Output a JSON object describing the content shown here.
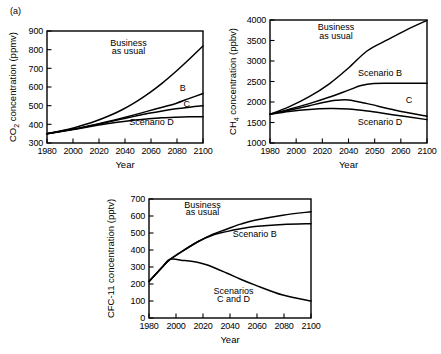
{
  "figure": {
    "panel_tag": "(a)",
    "xlabel": "Year"
  },
  "chart_data": [
    {
      "id": "co2",
      "type": "line",
      "title": "",
      "xlabel": "Year",
      "ylabel": "CO2 concentration (ppmv)",
      "ylabel_parts": {
        "pre": "CO",
        "sub": "2",
        "post": " concentration (ppmv)"
      },
      "xlim": [
        1985,
        2100
      ],
      "ylim": [
        300,
        900
      ],
      "yticks": [
        300,
        400,
        500,
        600,
        700,
        800,
        900
      ],
      "xticks": [
        1980,
        2000,
        2020,
        2040,
        2060,
        2080,
        2100
      ],
      "xtick_labels": [
        "1980",
        "2000",
        "2020",
        "2040",
        "2060",
        "2080",
        "2100"
      ],
      "grid": false,
      "legend": "inline-annotations",
      "annotations": [
        {
          "text": "Business",
          "x": 2045,
          "y": 820
        },
        {
          "text": "as usual",
          "x": 2045,
          "y": 775
        },
        {
          "text": "B",
          "x": 2085,
          "y": 580
        },
        {
          "text": "C",
          "x": 2088,
          "y": 495
        },
        {
          "text": "Scenario D",
          "x": 2062,
          "y": 395
        }
      ],
      "series": [
        {
          "name": "Business as usual",
          "x": [
            1985,
            2000,
            2010,
            2020,
            2030,
            2040,
            2050,
            2060,
            2070,
            2080,
            2090,
            2100
          ],
          "values": [
            350,
            372,
            392,
            415,
            443,
            477,
            518,
            566,
            621,
            683,
            750,
            820
          ]
        },
        {
          "name": "Scenario B",
          "x": [
            1985,
            2000,
            2010,
            2020,
            2030,
            2040,
            2050,
            2060,
            2070,
            2080,
            2090,
            2100
          ],
          "values": [
            350,
            369,
            382,
            398,
            415,
            433,
            452,
            472,
            492,
            512,
            539,
            565
          ]
        },
        {
          "name": "Scenario C",
          "x": [
            1985,
            2000,
            2010,
            2020,
            2030,
            2040,
            2050,
            2060,
            2070,
            2080,
            2090,
            2100
          ],
          "values": [
            350,
            368,
            381,
            396,
            412,
            428,
            444,
            459,
            472,
            483,
            492,
            500
          ]
        },
        {
          "name": "Scenario D",
          "x": [
            1985,
            2000,
            2010,
            2020,
            2030,
            2040,
            2050,
            2060,
            2070,
            2080,
            2090,
            2100
          ],
          "values": [
            350,
            367,
            379,
            392,
            404,
            414,
            423,
            430,
            435,
            438,
            440,
            441
          ]
        }
      ]
    },
    {
      "id": "ch4",
      "type": "line",
      "title": "",
      "xlabel": "Year",
      "ylabel": "CH4 concentration (ppbv)",
      "ylabel_parts": {
        "pre": "CH",
        "sub": "4",
        "post": " concentration (ppbv)"
      },
      "ylim": [
        1000,
        4000
      ],
      "yticks": [
        1000,
        1500,
        2000,
        2500,
        3000,
        3500,
        4000
      ],
      "xtick_labels": [
        "1980",
        "2000",
        "2020",
        "2040",
        "2050",
        "2060",
        "2100"
      ],
      "xtick_note": "ticks evenly spaced; labels as printed in original scan",
      "grid": false,
      "legend": "inline-annotations",
      "annotations": [
        {
          "text": "Business",
          "xfrac": 0.42,
          "y": 3760
        },
        {
          "text": "as usual",
          "xfrac": 0.42,
          "y": 3540
        },
        {
          "text": "Scenario B",
          "xfrac": 0.7,
          "y": 2640
        },
        {
          "text": "C",
          "xfrac": 0.885,
          "y": 1980
        },
        {
          "text": "Scenario D",
          "xfrac": 0.7,
          "y": 1430
        }
      ],
      "series": [
        {
          "name": "Business as usual",
          "xfrac": [
            0.0,
            0.12,
            0.25,
            0.38,
            0.5,
            0.62,
            0.75,
            0.87,
            1.0
          ],
          "values": [
            1700,
            1880,
            2130,
            2450,
            2830,
            3250,
            3520,
            3760,
            3990
          ]
        },
        {
          "name": "Scenario B",
          "xfrac": [
            0.0,
            0.12,
            0.25,
            0.38,
            0.5,
            0.58,
            0.66,
            0.8,
            1.0
          ],
          "values": [
            1700,
            1820,
            1960,
            2120,
            2290,
            2400,
            2450,
            2455,
            2460
          ]
        },
        {
          "name": "Scenario C",
          "xfrac": [
            0.0,
            0.12,
            0.25,
            0.33,
            0.42,
            0.5,
            0.62,
            0.8,
            1.0
          ],
          "values": [
            1700,
            1800,
            1910,
            1980,
            2040,
            2050,
            1960,
            1800,
            1650
          ]
        },
        {
          "name": "Scenario D",
          "xfrac": [
            0.0,
            0.12,
            0.25,
            0.38,
            0.5,
            0.62,
            0.78,
            1.0
          ],
          "values": [
            1700,
            1770,
            1820,
            1840,
            1830,
            1780,
            1690,
            1570
          ]
        }
      ]
    },
    {
      "id": "cfc11",
      "type": "line",
      "title": "",
      "xlabel": "Year",
      "ylabel": "CFC-11 concentration (pptv)",
      "xlim": [
        1985,
        2100
      ],
      "ylim": [
        0,
        700
      ],
      "yticks": [
        0,
        100,
        200,
        300,
        400,
        500,
        600,
        700
      ],
      "xticks": [
        1980,
        2000,
        2020,
        2040,
        2060,
        2080,
        2100
      ],
      "xtick_labels": [
        "1980",
        "2000",
        "2020",
        "2040",
        "2060",
        "2080",
        "2100"
      ],
      "grid": false,
      "legend": "inline-annotations",
      "annotations": [
        {
          "text": "Business",
          "x": 2023,
          "y": 650
        },
        {
          "text": "as usual",
          "x": 2023,
          "y": 605
        },
        {
          "text": "Scenario B",
          "x": 2060,
          "y": 475
        },
        {
          "text": "Scenarios",
          "x": 2045,
          "y": 140
        },
        {
          "text": "C and D",
          "x": 2045,
          "y": 95
        }
      ],
      "series": [
        {
          "name": "Business as usual",
          "x": [
            1985,
            1995,
            2000,
            2010,
            2020,
            2030,
            2040,
            2050,
            2060,
            2080,
            2100
          ],
          "values": [
            215,
            305,
            345,
            400,
            450,
            492,
            522,
            552,
            575,
            605,
            625
          ]
        },
        {
          "name": "Scenario B",
          "x": [
            1985,
            1995,
            2000,
            2010,
            2020,
            2030,
            2040,
            2050,
            2060,
            2080,
            2100
          ],
          "values": [
            215,
            305,
            345,
            400,
            450,
            487,
            508,
            525,
            538,
            550,
            555
          ]
        },
        {
          "name": "Scenarios C and D",
          "x": [
            1985,
            1995,
            2000,
            2010,
            2020,
            2027,
            2040,
            2050,
            2060,
            2080,
            2100
          ],
          "values": [
            215,
            305,
            345,
            338,
            327,
            310,
            265,
            228,
            195,
            135,
            100
          ]
        }
      ]
    }
  ]
}
